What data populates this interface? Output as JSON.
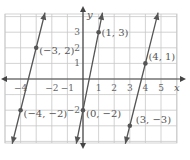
{
  "chart_data": {
    "type": "line",
    "title": "",
    "xlabel": "x",
    "ylabel": "y",
    "xlim": [
      -5,
      6
    ],
    "ylim": [
      -4,
      4
    ],
    "grid": true,
    "x_ticks": [
      "-4",
      "-2",
      "-1",
      "1",
      "2",
      "3",
      "4",
      "5"
    ],
    "y_ticks": [
      "3",
      "2",
      "1",
      "-2"
    ],
    "series": [
      {
        "name": "line-a",
        "points": [
          [
            -4,
            -2
          ],
          [
            -3,
            2
          ]
        ],
        "slope": 4
      },
      {
        "name": "line-b",
        "points": [
          [
            0,
            -2
          ],
          [
            1,
            3
          ]
        ],
        "slope": 5
      },
      {
        "name": "line-c",
        "points": [
          [
            3,
            -3
          ],
          [
            4,
            1
          ]
        ],
        "slope": 4
      }
    ],
    "annotations": [
      {
        "text": "(−3, 2)",
        "point": [
          -3,
          2
        ]
      },
      {
        "text": "(−4, −2)",
        "point": [
          -4,
          -2
        ]
      },
      {
        "text": "(1, 3)",
        "point": [
          1,
          3
        ]
      },
      {
        "text": "(0, −2)",
        "point": [
          0,
          -2
        ]
      },
      {
        "text": "(4, 1)",
        "point": [
          4,
          1
        ]
      },
      {
        "text": "(3, −3)",
        "point": [
          3,
          -3
        ]
      }
    ]
  }
}
